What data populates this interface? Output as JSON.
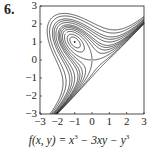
{
  "problem": {
    "number": "6."
  },
  "chart_data": {
    "type": "contour",
    "title": "",
    "function": "f(x, y) = x^3 - 3xy - y^3",
    "caption": {
      "prefix": "f(x, y) = x",
      "exp1": "3",
      "mid": " − 3xy − y",
      "exp2": "3"
    },
    "xlabel": "",
    "ylabel": "",
    "xlim": [
      -3,
      3
    ],
    "ylim": [
      -3,
      3
    ],
    "xticks": [
      -3,
      -2,
      -1,
      0,
      1,
      2,
      3
    ],
    "yticks": [
      -3,
      -2,
      -1,
      0,
      1,
      2,
      3
    ],
    "xtick_labels": [
      "−3",
      "−2",
      "−1",
      "0",
      "1",
      "2",
      "3"
    ],
    "ytick_labels": [
      "−3",
      "−2",
      "−1",
      "0",
      "1",
      "2",
      "3"
    ],
    "grid": false,
    "critical_points": [
      {
        "x": -1,
        "y": 1,
        "type": "local maximum",
        "marked": true
      },
      {
        "x": 0,
        "y": 0,
        "type": "saddle point",
        "marked": false
      }
    ],
    "contour_levels": [
      -9,
      -7,
      -5,
      -4,
      -3,
      -2,
      -1.5,
      -1,
      -0.5,
      0,
      0.5,
      0.8
    ],
    "line_color": "#231f20"
  }
}
